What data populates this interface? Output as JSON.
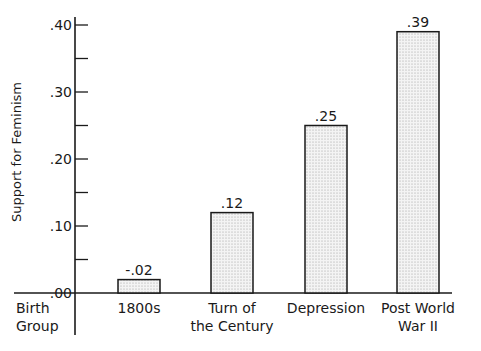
{
  "chart_data": {
    "type": "bar",
    "title": "",
    "xlabel": "Birth Group",
    "ylabel": "Support for Feminism",
    "categories": [
      "1800s",
      "Turn of the Century",
      "Depression",
      "Post World War II"
    ],
    "category_lines": [
      [
        "1800s"
      ],
      [
        "Turn of",
        "the Century"
      ],
      [
        "Depression"
      ],
      [
        "Post World",
        "War II"
      ]
    ],
    "values": [
      -0.02,
      0.12,
      0.25,
      0.39
    ],
    "value_labels": [
      "-.02",
      ".12",
      ".25",
      ".39"
    ],
    "ylim": [
      0,
      0.4
    ],
    "yticks": [
      0.0,
      0.1,
      0.2,
      0.3,
      0.4
    ],
    "ytick_labels": [
      ".00",
      ".10",
      ".20",
      ".30",
      ".40"
    ],
    "minor_yticks": [
      0.05,
      0.15,
      0.25,
      0.35
    ],
    "grid": false,
    "legend": null,
    "bar_fill": "stippled light gray",
    "bar_color": "#e6e6e6",
    "edge_color": "#1a1a1a"
  },
  "labels": {
    "y_axis_title": "Support for Feminism",
    "x_axis_title_line1": "Birth",
    "x_axis_title_line2": "Group"
  }
}
